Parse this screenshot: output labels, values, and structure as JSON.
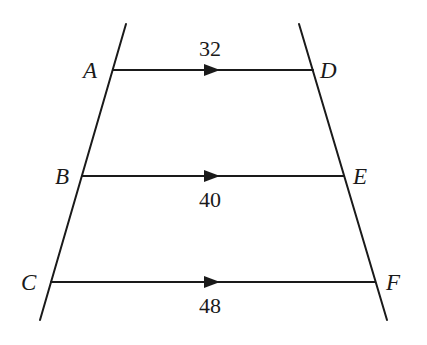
{
  "diagram": {
    "transversals": [
      {
        "name": "left",
        "from": [
          126,
          24
        ],
        "to": [
          40,
          320
        ]
      },
      {
        "name": "right",
        "from": [
          299,
          24
        ],
        "to": [
          387,
          320
        ]
      }
    ],
    "points": {
      "A": {
        "label": "A",
        "x": 113,
        "y": 70
      },
      "B": {
        "label": "B",
        "x": 82,
        "y": 176
      },
      "C": {
        "label": "C",
        "x": 51,
        "y": 282
      },
      "D": {
        "label": "D",
        "x": 313,
        "y": 70
      },
      "E": {
        "label": "E",
        "x": 344,
        "y": 176
      },
      "F": {
        "label": "F",
        "x": 375,
        "y": 282
      }
    },
    "segments": [
      {
        "name": "AD",
        "from": "A",
        "to": "D",
        "length": "32",
        "label_position": "above"
      },
      {
        "name": "BE",
        "from": "B",
        "to": "E",
        "length": "40",
        "label_position": "below"
      },
      {
        "name": "CF",
        "from": "C",
        "to": "F",
        "length": "48",
        "label_position": "below"
      }
    ],
    "parallel_marker": "single-arrow",
    "colors": {
      "stroke": "#1a1a1a",
      "background": "#ffffff"
    }
  }
}
